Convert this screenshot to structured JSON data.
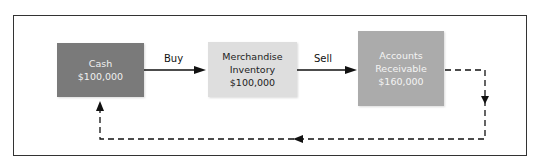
{
  "diagram": {
    "nodes": [
      {
        "id": "cash",
        "lines": [
          "Cash",
          "$100,000"
        ],
        "fill": "#7a7a7a"
      },
      {
        "id": "merchandise-inventory",
        "lines": [
          "Merchandise",
          "Inventory",
          "$100,000"
        ],
        "fill": "#dedede"
      },
      {
        "id": "accounts-receivable",
        "lines": [
          "Accounts",
          "Receivable",
          "$160,000"
        ],
        "fill": "#ababab"
      }
    ],
    "edges": [
      {
        "from": "cash",
        "to": "merchandise-inventory",
        "label": "Buy",
        "style": "solid"
      },
      {
        "from": "merchandise-inventory",
        "to": "accounts-receivable",
        "label": "Sell",
        "style": "solid"
      },
      {
        "from": "accounts-receivable",
        "to": "cash",
        "label": "",
        "style": "dashed"
      }
    ],
    "colors": {
      "line": "#111111",
      "border": "#333333"
    }
  }
}
